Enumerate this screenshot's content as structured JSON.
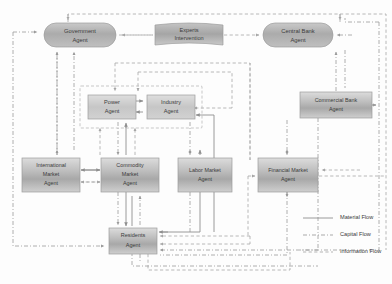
{
  "diagram": {
    "type": "flow-diagram",
    "width": 392,
    "height": 284,
    "background": "#fdfdfd"
  },
  "nodes": {
    "government": {
      "label_line1": "Government",
      "label_line2": "Agent",
      "shape": "rounded-pill",
      "x": 44,
      "y": 23,
      "w": 72,
      "h": 24,
      "fill": "#b0b0b0"
    },
    "experts": {
      "label_line1": "Experts",
      "label_line2": "Intervention",
      "shape": "banner",
      "x": 155,
      "y": 25,
      "w": 68,
      "h": 20,
      "fill": "#a8a8a8"
    },
    "central_bank": {
      "label_line1": "Central Bank",
      "label_line2": "Agent",
      "shape": "rounded-pill",
      "x": 263,
      "y": 23,
      "w": 70,
      "h": 24,
      "fill": "#b0b0b0"
    },
    "commercial_bank": {
      "label_line1": "Commercial Bank",
      "label_line2": "Agent",
      "shape": "rect",
      "x": 300,
      "y": 92,
      "w": 72,
      "h": 26,
      "fill": "#c2c2c2"
    },
    "power": {
      "label_line1": "Power",
      "label_line2": "Agent",
      "shape": "rect",
      "x": 88,
      "y": 95,
      "w": 46,
      "h": 24,
      "fill": "#c4c4c4"
    },
    "industry": {
      "label_line1": "Industry",
      "label_line2": "Agent",
      "shape": "rect",
      "x": 145,
      "y": 95,
      "w": 46,
      "h": 24,
      "fill": "#c4c4c4"
    },
    "international_market": {
      "label_line1": "International",
      "label_line2": "Market",
      "label_line3": "Agent",
      "shape": "rect",
      "x": 22,
      "y": 158,
      "w": 56,
      "h": 32,
      "fill": "#bdbdbd"
    },
    "commodity_market": {
      "label_line1": "Commodity",
      "label_line2": "Market",
      "label_line3": "Agent",
      "shape": "rect",
      "x": 103,
      "y": 158,
      "w": 56,
      "h": 32,
      "fill": "#bdbdbd"
    },
    "labor_market": {
      "label_line1": "Labor Market",
      "label_line2": "Agent",
      "shape": "rect",
      "x": 178,
      "y": 158,
      "w": 52,
      "h": 32,
      "fill": "#bdbdbd"
    },
    "financial_market": {
      "label_line1": "Financial Market",
      "label_line2": "Agent",
      "shape": "rect",
      "x": 258,
      "y": 158,
      "w": 58,
      "h": 32,
      "fill": "#bdbdbd"
    },
    "residents": {
      "label_line1": "Residents",
      "label_line2": "Agent",
      "shape": "rect",
      "x": 109,
      "y": 228,
      "w": 46,
      "h": 24,
      "fill": "#bcbcbc"
    }
  },
  "legend": {
    "items": [
      {
        "label": "Material Flow",
        "style": "solid",
        "color": "#8e8e8e"
      },
      {
        "label": "Capital Flow",
        "style": "dash-dot",
        "color": "#9a9a9a"
      },
      {
        "label": "Information Flow",
        "style": "dashed",
        "color": "#a6a6a6"
      }
    ],
    "x": 303,
    "y": 218,
    "line_length": 30,
    "row_gap": 17
  },
  "colors": {
    "node_fill_light": "#d6d6d6",
    "node_fill_mid": "#b2b2b2",
    "node_border": "#9c9c9c",
    "text": "#3b3b3b",
    "solid_line": "#8e8e8e",
    "dashdot_line": "#9a9a9a",
    "dashed_line": "#a6a6a6",
    "container_border": "#b9b9b9"
  }
}
